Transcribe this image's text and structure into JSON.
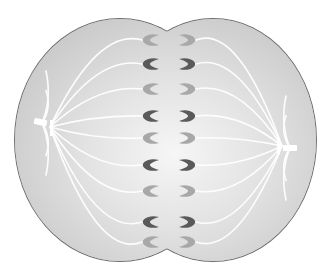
{
  "diagram": {
    "colors": {
      "background": "#ffffff",
      "cytoplasm": "#cfcfcf",
      "cytoplasm_center": "#f4f4f4",
      "membrane": "#6e6e6e",
      "spindle_fiber": "#ffffff",
      "chromosome_dark": "#5a5a5a",
      "chromosome_light": "#a8a8a8"
    },
    "cell": {
      "cx": 168,
      "cy": 140,
      "left_lobe": {
        "cx": 120,
        "cy": 140,
        "rx": 105,
        "ry": 121
      },
      "right_lobe": {
        "cx": 213,
        "cy": 140,
        "rx": 103,
        "ry": 121
      }
    },
    "poles": [
      {
        "name": "left-centriole",
        "x": 42,
        "y": 123
      },
      {
        "name": "right-centriole",
        "x": 290,
        "y": 148
      }
    ],
    "chromosome_pairs": [
      {
        "y": 40,
        "shade": "light"
      },
      {
        "y": 64,
        "shade": "dark"
      },
      {
        "y": 89,
        "shade": "light"
      },
      {
        "y": 116,
        "shade": "dark"
      },
      {
        "y": 138,
        "shade": "light"
      },
      {
        "y": 165,
        "shade": "dark"
      },
      {
        "y": 191,
        "shade": "light"
      },
      {
        "y": 222,
        "shade": "dark"
      },
      {
        "y": 242,
        "shade": "light"
      }
    ]
  }
}
